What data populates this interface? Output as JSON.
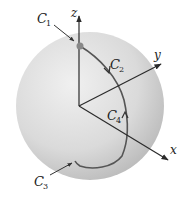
{
  "figure": {
    "colors": {
      "sphere_light": "#ededed",
      "sphere_dark": "#b9b9b9",
      "axis": "#2b2b2b",
      "curve": "#555555",
      "point": "#888888"
    },
    "axes": {
      "x": "x",
      "y": "y",
      "z": "z"
    },
    "curves": [
      {
        "name": "C",
        "index": "1"
      },
      {
        "name": "C",
        "index": "2"
      },
      {
        "name": "C",
        "index": "3"
      },
      {
        "name": "C",
        "index": "4"
      }
    ]
  }
}
